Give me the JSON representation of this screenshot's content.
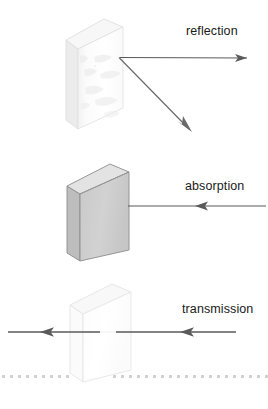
{
  "figure": {
    "width": 268,
    "height": 409,
    "background_color": "#ffffff"
  },
  "labels": {
    "reflection": "reflection",
    "absorption": "absorption",
    "transmission": "transmission"
  },
  "colors": {
    "arrow": "#5a5a5a",
    "arrow_dark": "#4a4a4a",
    "block_outline_gray": "#8c8c8c",
    "block_face_gray": "#cccccc",
    "block_top_gray": "#e2e2e2",
    "block_side_gray": "#b8b8b8",
    "block_outline_light": "#e2e2e2",
    "block_face_white": "#fdfdfd",
    "block_top_white": "#f6f6f6",
    "block_side_white": "#ececec",
    "texture_shadow": "#ededed",
    "dotted_line": "#d0d0d0",
    "text": "#1a1a1a"
  },
  "scenes": [
    {
      "name": "reflection",
      "label": "reflection",
      "block_type": "rough-white-block",
      "block_description": "white textured (rough surface) block in isometric view",
      "arrows": [
        {
          "name": "incoming-ray",
          "direction": "leftward",
          "from": [
            247,
            58
          ],
          "to": [
            120,
            57
          ]
        },
        {
          "name": "reflected-ray",
          "direction": "down-right",
          "from": [
            119,
            58
          ],
          "to": [
            191,
            131
          ]
        }
      ]
    },
    {
      "name": "absorption",
      "label": "absorption",
      "block_type": "solid-gray-block",
      "block_description": "opaque gray block in isometric view",
      "arrows": [
        {
          "name": "incoming-ray",
          "direction": "leftward",
          "from": [
            265,
            206
          ],
          "to": [
            128,
            206
          ]
        }
      ]
    },
    {
      "name": "transmission",
      "label": "transmission",
      "block_type": "transparent-block",
      "block_description": "transparent/clear block in isometric view",
      "arrows": [
        {
          "name": "incoming-ray",
          "direction": "leftward",
          "from": [
            236,
            332
          ],
          "to": [
            116,
            332
          ]
        },
        {
          "name": "outgoing-ray",
          "direction": "leftward",
          "from": [
            100,
            332
          ],
          "to": [
            8,
            332
          ]
        }
      ],
      "dotted_baseline": {
        "name": "dotted-baseline",
        "y": 376,
        "dot_spacing": 8,
        "dot_size": 3
      }
    }
  ]
}
